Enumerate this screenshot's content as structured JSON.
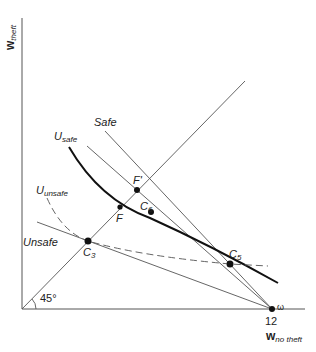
{
  "axes": {
    "x_label_main": "w",
    "x_label_sub": "no theft",
    "y_label_main": "w",
    "y_label_sub": "theft",
    "x_tick_label": "12",
    "endowment_label": "ω",
    "angle_label": "45°"
  },
  "curves": {
    "safe_line_label": "Safe",
    "unsafe_line_label": "Unsafe",
    "u_safe_main": "U",
    "u_safe_sub": "safe",
    "u_unsafe_main": "U",
    "u_unsafe_sub": "unsafe"
  },
  "points": {
    "f_prime": "F'",
    "f": "F",
    "c6_main": "C",
    "c6_sub": "6",
    "c3_main": "C",
    "c3_sub": "3",
    "c5_main": "C",
    "c5_sub": "5"
  },
  "colors": {
    "line": "#555555",
    "curve": "#111111",
    "background": "#ffffff"
  }
}
